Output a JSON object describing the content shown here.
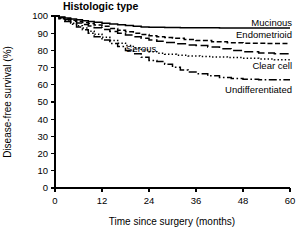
{
  "chart_data": {
    "type": "line",
    "title": "Histologic type",
    "xlabel": "Time since surgery (months)",
    "ylabel": "Disease-free survival (%)",
    "xlim": [
      0,
      60
    ],
    "ylim": [
      0,
      100
    ],
    "xticks": [
      0,
      12,
      24,
      36,
      48,
      60
    ],
    "yticks": [
      0,
      10,
      20,
      30,
      40,
      50,
      60,
      70,
      80,
      90,
      100
    ],
    "xtick_labels": [
      "0",
      "12",
      "24",
      "36",
      "48",
      "60"
    ],
    "ytick_labels": [
      "0",
      "10",
      "20",
      "30",
      "40",
      "50",
      "60",
      "70",
      "80",
      "90",
      "100"
    ],
    "grid": false,
    "legend_position": "right-inline-labels",
    "step_plot": true,
    "series": [
      {
        "name": "Mucinous",
        "linestyle": "solid",
        "dasharray": "",
        "label_x": 60,
        "label_y": 96,
        "x": [
          0,
          1,
          2.5,
          4,
          5.5,
          7,
          8.5,
          10,
          12,
          14,
          16,
          18,
          20,
          22,
          24,
          28,
          32,
          36,
          42,
          48,
          54,
          60
        ],
        "y": [
          100,
          99.4,
          98.8,
          98.3,
          97.8,
          97.3,
          96.8,
          96.3,
          95.8,
          95.3,
          94.9,
          94.5,
          94.0,
          93.6,
          93.4,
          93.3,
          93.2,
          93.1,
          93.0,
          93.0,
          93.0,
          93.0
        ]
      },
      {
        "name": "Endometrioid",
        "linestyle": "dashed",
        "dasharray": "5,2.5",
        "label_x": 60,
        "label_y": 89,
        "x": [
          0,
          1,
          2.5,
          4,
          5.5,
          7,
          8.5,
          10,
          12,
          14,
          16,
          18,
          20,
          22,
          24,
          26,
          28,
          30,
          33,
          36,
          40,
          44,
          48,
          54,
          60
        ],
        "y": [
          100,
          99.2,
          98.4,
          97.6,
          96.9,
          96.2,
          95.6,
          94.8,
          94.0,
          92.8,
          91.7,
          90.8,
          90.0,
          89.2,
          88.5,
          88.0,
          87.5,
          87.0,
          86.3,
          85.7,
          85.0,
          84.5,
          84.2,
          84.0,
          84.0
        ]
      },
      {
        "name": "Serous",
        "linestyle": "long-dash",
        "dasharray": "9,3.5",
        "label_x": 22,
        "label_y": 81,
        "x": [
          0,
          1,
          2.5,
          4,
          5.5,
          7,
          8.5,
          10,
          12,
          14,
          16,
          18,
          20,
          22,
          24,
          26,
          28,
          31,
          34,
          36,
          39,
          42,
          45,
          48,
          52,
          56,
          60
        ],
        "y": [
          100,
          99.0,
          98.0,
          97.0,
          96.0,
          95.0,
          94.2,
          93.2,
          92.2,
          91.0,
          90.0,
          89.0,
          88.0,
          87.0,
          86.0,
          85.3,
          84.6,
          83.8,
          83.2,
          82.9,
          82.0,
          81.0,
          80.0,
          79.2,
          78.5,
          78.0,
          78.0
        ]
      },
      {
        "name": "Clear cell",
        "linestyle": "dotted",
        "dasharray": "1.4,2.2",
        "label_x": 60,
        "label_y": 71,
        "x": [
          0,
          1,
          2.5,
          4,
          5.5,
          7,
          8.5,
          10,
          12,
          14,
          16,
          18,
          20,
          22,
          24,
          26,
          28,
          31,
          34,
          37,
          40,
          44,
          48,
          52,
          56,
          60
        ],
        "y": [
          100,
          98.6,
          97.2,
          95.8,
          94.4,
          93.0,
          91.2,
          89.4,
          87.6,
          85.8,
          84.2,
          82.8,
          81.4,
          80.2,
          79.2,
          78.4,
          77.8,
          77.2,
          76.8,
          76.5,
          76.2,
          75.8,
          75.4,
          75.0,
          74.5,
          74.3
        ]
      },
      {
        "name": "Undifferentiated",
        "linestyle": "dash-dot",
        "dasharray": "8,2.5,1.6,2.5",
        "label_x": 60,
        "label_y": 57,
        "x": [
          0,
          1,
          2.5,
          4,
          5.5,
          7,
          8.5,
          10,
          12,
          14,
          16,
          18,
          20,
          22,
          24,
          26,
          28,
          30,
          32,
          34,
          36,
          39,
          42,
          45,
          48,
          52,
          56,
          60
        ],
        "y": [
          100,
          98.4,
          96.8,
          95.2,
          93.6,
          92.0,
          90.0,
          88.0,
          86.0,
          84.0,
          82.2,
          80.0,
          78.0,
          76.0,
          74.2,
          73.6,
          72.0,
          70.2,
          68.6,
          67.4,
          66.4,
          65.2,
          64.2,
          63.6,
          63.2,
          63.0,
          63.0,
          63.0
        ]
      }
    ]
  }
}
